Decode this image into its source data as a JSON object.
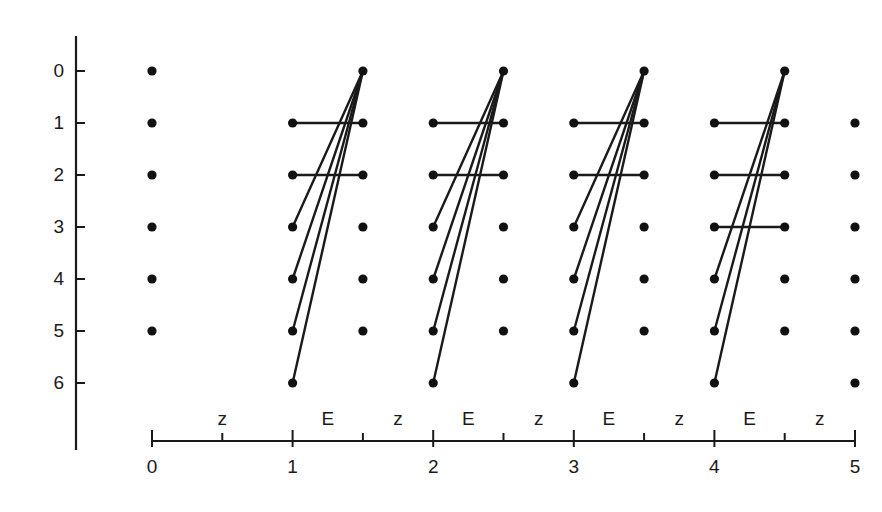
{
  "figure": {
    "title": "",
    "background_color": "#ffffff",
    "ink_color": "#1a1a1a"
  },
  "chart_data": {
    "type": "scatter",
    "title": "",
    "xlabel": "",
    "ylabel": "",
    "xlim": [
      0,
      5
    ],
    "ylim": [
      6,
      0
    ],
    "grid": false,
    "legend": null,
    "x_axis": {
      "tick_values": [
        0,
        1,
        2,
        3,
        4,
        5
      ],
      "tick_labels": [
        "0",
        "1",
        "2",
        "3",
        "4",
        "5"
      ],
      "minor_tick_values": [
        0.5,
        1.5,
        2.5,
        3.5,
        4.5
      ],
      "segment_labels": [
        {
          "label": "z",
          "center": 0.5
        },
        {
          "label": "E",
          "center": 1.25
        },
        {
          "label": "z",
          "center": 1.75
        },
        {
          "label": "E",
          "center": 2.25
        },
        {
          "label": "z",
          "center": 2.75
        },
        {
          "label": "E",
          "center": 3.25
        },
        {
          "label": "z",
          "center": 3.75
        },
        {
          "label": "E",
          "center": 4.25
        },
        {
          "label": "z",
          "center": 4.75
        }
      ]
    },
    "y_axis": {
      "tick_values": [
        0,
        1,
        2,
        3,
        4,
        5,
        6
      ],
      "tick_labels": [
        "0",
        "1",
        "2",
        "3",
        "4",
        "5",
        "6"
      ],
      "direction": "down"
    },
    "nodes": [
      {
        "x": 0,
        "y": 0
      },
      {
        "x": 1.5,
        "y": 0
      },
      {
        "x": 2.5,
        "y": 0
      },
      {
        "x": 3.5,
        "y": 0
      },
      {
        "x": 4.5,
        "y": 0
      },
      {
        "x": 0,
        "y": 1
      },
      {
        "x": 1,
        "y": 1
      },
      {
        "x": 1.5,
        "y": 1
      },
      {
        "x": 2,
        "y": 1
      },
      {
        "x": 2.5,
        "y": 1
      },
      {
        "x": 3,
        "y": 1
      },
      {
        "x": 3.5,
        "y": 1
      },
      {
        "x": 4,
        "y": 1
      },
      {
        "x": 4.5,
        "y": 1
      },
      {
        "x": 5,
        "y": 1
      },
      {
        "x": 0,
        "y": 2
      },
      {
        "x": 1,
        "y": 2
      },
      {
        "x": 1.5,
        "y": 2
      },
      {
        "x": 2,
        "y": 2
      },
      {
        "x": 2.5,
        "y": 2
      },
      {
        "x": 3,
        "y": 2
      },
      {
        "x": 3.5,
        "y": 2
      },
      {
        "x": 4,
        "y": 2
      },
      {
        "x": 4.5,
        "y": 2
      },
      {
        "x": 5,
        "y": 2
      },
      {
        "x": 0,
        "y": 3
      },
      {
        "x": 1,
        "y": 3
      },
      {
        "x": 1.5,
        "y": 3
      },
      {
        "x": 2,
        "y": 3
      },
      {
        "x": 2.5,
        "y": 3
      },
      {
        "x": 3,
        "y": 3
      },
      {
        "x": 3.5,
        "y": 3
      },
      {
        "x": 4,
        "y": 3
      },
      {
        "x": 4.5,
        "y": 3
      },
      {
        "x": 5,
        "y": 3
      },
      {
        "x": 0,
        "y": 4
      },
      {
        "x": 1,
        "y": 4
      },
      {
        "x": 1.5,
        "y": 4
      },
      {
        "x": 2,
        "y": 4
      },
      {
        "x": 2.5,
        "y": 4
      },
      {
        "x": 3,
        "y": 4
      },
      {
        "x": 3.5,
        "y": 4
      },
      {
        "x": 4,
        "y": 4
      },
      {
        "x": 4.5,
        "y": 4
      },
      {
        "x": 5,
        "y": 4
      },
      {
        "x": 0,
        "y": 5
      },
      {
        "x": 1,
        "y": 5
      },
      {
        "x": 1.5,
        "y": 5
      },
      {
        "x": 2,
        "y": 5
      },
      {
        "x": 2.5,
        "y": 5
      },
      {
        "x": 3,
        "y": 5
      },
      {
        "x": 3.5,
        "y": 5
      },
      {
        "x": 4,
        "y": 5
      },
      {
        "x": 4.5,
        "y": 5
      },
      {
        "x": 5,
        "y": 5
      },
      {
        "x": 1,
        "y": 6
      },
      {
        "x": 2,
        "y": 6
      },
      {
        "x": 3,
        "y": 6
      },
      {
        "x": 4,
        "y": 6
      },
      {
        "x": 5,
        "y": 6
      }
    ],
    "edges": [
      {
        "group": 1,
        "kind": "horizontal",
        "x1": 1,
        "y1": 1,
        "x2": 1.5,
        "y2": 1
      },
      {
        "group": 1,
        "kind": "horizontal",
        "x1": 1,
        "y1": 2,
        "x2": 1.5,
        "y2": 2
      },
      {
        "group": 1,
        "kind": "diagonal",
        "x1": 1,
        "y1": 3,
        "x2": 1.5,
        "y2": 0
      },
      {
        "group": 1,
        "kind": "diagonal",
        "x1": 1,
        "y1": 4,
        "x2": 1.5,
        "y2": 0
      },
      {
        "group": 1,
        "kind": "diagonal",
        "x1": 1,
        "y1": 5,
        "x2": 1.5,
        "y2": 0
      },
      {
        "group": 1,
        "kind": "diagonal",
        "x1": 1,
        "y1": 6,
        "x2": 1.5,
        "y2": 0
      },
      {
        "group": 2,
        "kind": "horizontal",
        "x1": 2,
        "y1": 1,
        "x2": 2.5,
        "y2": 1
      },
      {
        "group": 2,
        "kind": "horizontal",
        "x1": 2,
        "y1": 2,
        "x2": 2.5,
        "y2": 2
      },
      {
        "group": 2,
        "kind": "diagonal",
        "x1": 2,
        "y1": 3,
        "x2": 2.5,
        "y2": 0
      },
      {
        "group": 2,
        "kind": "diagonal",
        "x1": 2,
        "y1": 4,
        "x2": 2.5,
        "y2": 0
      },
      {
        "group": 2,
        "kind": "diagonal",
        "x1": 2,
        "y1": 5,
        "x2": 2.5,
        "y2": 0
      },
      {
        "group": 2,
        "kind": "diagonal",
        "x1": 2,
        "y1": 6,
        "x2": 2.5,
        "y2": 0
      },
      {
        "group": 3,
        "kind": "horizontal",
        "x1": 3,
        "y1": 1,
        "x2": 3.5,
        "y2": 1
      },
      {
        "group": 3,
        "kind": "horizontal",
        "x1": 3,
        "y1": 2,
        "x2": 3.5,
        "y2": 2
      },
      {
        "group": 3,
        "kind": "diagonal",
        "x1": 3,
        "y1": 3,
        "x2": 3.5,
        "y2": 0
      },
      {
        "group": 3,
        "kind": "diagonal",
        "x1": 3,
        "y1": 4,
        "x2": 3.5,
        "y2": 0
      },
      {
        "group": 3,
        "kind": "diagonal",
        "x1": 3,
        "y1": 5,
        "x2": 3.5,
        "y2": 0
      },
      {
        "group": 3,
        "kind": "diagonal",
        "x1": 3,
        "y1": 6,
        "x2": 3.5,
        "y2": 0
      },
      {
        "group": 4,
        "kind": "horizontal",
        "x1": 4,
        "y1": 1,
        "x2": 4.5,
        "y2": 1
      },
      {
        "group": 4,
        "kind": "horizontal",
        "x1": 4,
        "y1": 2,
        "x2": 4.5,
        "y2": 2
      },
      {
        "group": 4,
        "kind": "horizontal",
        "x1": 4,
        "y1": 3,
        "x2": 4.5,
        "y2": 3
      },
      {
        "group": 4,
        "kind": "diagonal",
        "x1": 4,
        "y1": 4,
        "x2": 4.5,
        "y2": 0
      },
      {
        "group": 4,
        "kind": "diagonal",
        "x1": 4,
        "y1": 5,
        "x2": 4.5,
        "y2": 0
      },
      {
        "group": 4,
        "kind": "diagonal",
        "x1": 4,
        "y1": 6,
        "x2": 4.5,
        "y2": 0
      }
    ]
  }
}
